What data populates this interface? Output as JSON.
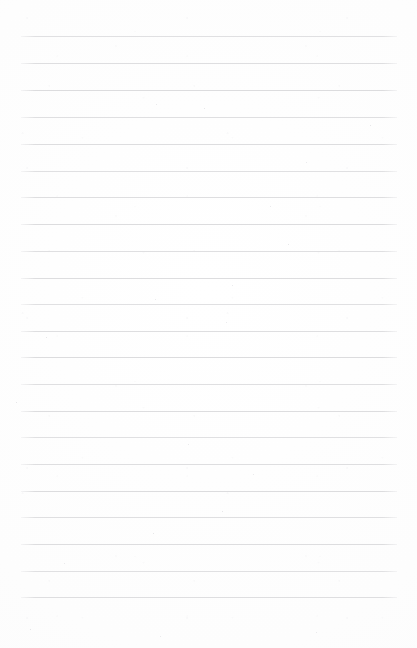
{
  "document": {
    "kind": "lined-paper",
    "title": "Blank ruled notebook page",
    "description": "A blank scanned sheet of ruled writing paper with no handwriting or printed text",
    "page_width": 417,
    "page_height": 648,
    "background_color": "#fefefe",
    "paper_tone": "#fdfdfd",
    "content_text": "",
    "has_text": false
  },
  "ruling": {
    "line_color": "#dcdcde",
    "line_thickness": 1,
    "line_count": 22,
    "line_left": 21,
    "line_right": 397,
    "line_width": 376,
    "first_line_y": 36,
    "last_line_y": 597,
    "line_spacing": 26.7,
    "margin_left": 21,
    "margin_right": 20,
    "margin_top": 36,
    "margin_bottom": 51,
    "has_vertical_margin_rule": false,
    "lines_y": [
      36,
      63,
      90,
      117,
      144,
      171,
      197,
      224,
      251,
      278,
      304,
      331,
      357,
      384,
      411,
      437,
      464,
      491,
      517,
      544,
      571,
      597
    ]
  },
  "marks": {
    "specks": [
      {
        "x": 204,
        "y": 108,
        "size": 1.1
      },
      {
        "x": 156,
        "y": 104,
        "size": 0.9
      },
      {
        "x": 370,
        "y": 125,
        "size": 1.0
      },
      {
        "x": 306,
        "y": 162,
        "size": 0.9
      },
      {
        "x": 270,
        "y": 206,
        "size": 0.8
      },
      {
        "x": 288,
        "y": 244,
        "size": 1.0
      },
      {
        "x": 232,
        "y": 285,
        "size": 0.9
      },
      {
        "x": 155,
        "y": 299,
        "size": 0.9
      },
      {
        "x": 46,
        "y": 337,
        "size": 1.2
      },
      {
        "x": 226,
        "y": 322,
        "size": 0.9
      },
      {
        "x": 16,
        "y": 402,
        "size": 1.1
      },
      {
        "x": 188,
        "y": 444,
        "size": 0.9
      },
      {
        "x": 253,
        "y": 474,
        "size": 0.9
      },
      {
        "x": 222,
        "y": 511,
        "size": 1.3
      },
      {
        "x": 153,
        "y": 533,
        "size": 1.1
      },
      {
        "x": 64,
        "y": 563,
        "size": 0.9
      },
      {
        "x": 30,
        "y": 629,
        "size": 1.0
      },
      {
        "x": 160,
        "y": 636,
        "size": 0.9
      },
      {
        "x": 316,
        "y": 632,
        "size": 0.9
      }
    ]
  }
}
